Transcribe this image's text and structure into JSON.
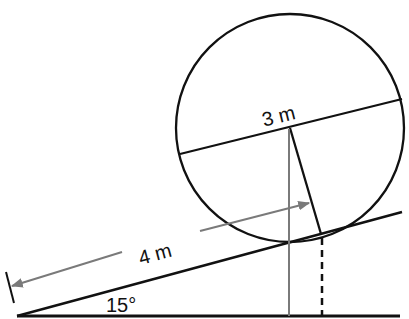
{
  "diagram": {
    "labels": {
      "diameter": "3 m",
      "distance_along_incline": "4 m",
      "incline_angle": "15°"
    },
    "colors": {
      "ink": "#111111",
      "dimension_gray": "#7a7a7a",
      "background": "#ffffff"
    }
  }
}
